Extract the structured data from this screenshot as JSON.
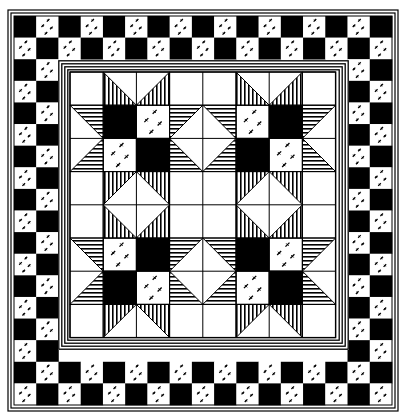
{
  "colors": {
    "ink": "#000000",
    "paper": "#ffffff"
  },
  "frame": {
    "x": 8,
    "y": 10,
    "w": 390,
    "h": 401
  },
  "checker_border": {
    "x": 14,
    "y": 16,
    "w": 378,
    "h": 389,
    "cell": 22,
    "band_cells": 2,
    "first_cell": "black",
    "light_cell_fill": "dotted"
  },
  "inner_stripe_border": {
    "x": 58,
    "y": 60,
    "w": 291,
    "h": 290,
    "lines": 4
  },
  "grid": {
    "x": 70,
    "y": 72,
    "cols": 8,
    "rows": 8,
    "cell": 33.2
  },
  "stars": [
    {
      "name": "star-top-left",
      "col": 1,
      "row": 1,
      "center": [
        [
          "black",
          "dotted"
        ],
        [
          "dotted",
          "black"
        ]
      ]
    },
    {
      "name": "star-top-right",
      "col": 5,
      "row": 1,
      "center": [
        [
          "dotted",
          "black"
        ],
        [
          "black",
          "dotted"
        ]
      ]
    },
    {
      "name": "star-bottom-left",
      "col": 1,
      "row": 5,
      "center": [
        [
          "dotted",
          "black"
        ],
        [
          "black",
          "dotted"
        ]
      ]
    },
    {
      "name": "star-bottom-right",
      "col": 5,
      "row": 5,
      "center": [
        [
          "black",
          "dotted"
        ],
        [
          "dotted",
          "black"
        ]
      ]
    }
  ]
}
